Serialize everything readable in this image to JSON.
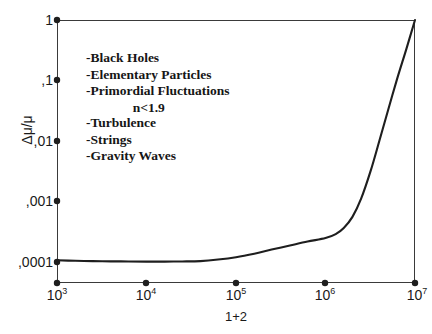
{
  "chart_data": {
    "type": "line",
    "title": "",
    "xlabel": "1+2",
    "ylabel": "Δμ/μ",
    "xscale": "log",
    "yscale": "log",
    "xlim": [
      1000,
      10000000
    ],
    "ylim": [
      5e-05,
      1
    ],
    "grid": false,
    "legend": null,
    "x_tick_labels": [
      "10",
      "10",
      "10",
      "10",
      "10"
    ],
    "x_tick_exponents": [
      "3",
      "4",
      "5",
      "6",
      "7"
    ],
    "x_tick_values": [
      1000,
      10000,
      100000,
      1000000,
      10000000
    ],
    "y_tick_labels": [
      "1",
      ",1",
      ",01",
      ",001",
      ",0001"
    ],
    "y_tick_values": [
      1,
      0.1,
      0.01,
      0.001,
      0.0001
    ],
    "series": [
      {
        "name": "Δμ/μ",
        "color": "#1e1e1e",
        "x": [
          1000,
          1600,
          2500,
          4000,
          6300,
          10000,
          16000,
          25000,
          40000,
          63000,
          100000,
          160000,
          250000,
          400000,
          630000,
          1000000,
          1300000,
          1600000,
          2000000,
          2500000,
          3200000,
          4000000,
          5000000,
          6300000,
          8000000,
          10000000
        ],
        "y": [
          0.000105,
          0.000103,
          0.000102,
          0.000101,
          0.0001005,
          0.0001,
          0.0001,
          0.0001005,
          0.000102,
          0.000108,
          0.000118,
          0.000135,
          0.000158,
          0.000185,
          0.000215,
          0.000245,
          0.000285,
          0.00036,
          0.00055,
          0.0011,
          0.0032,
          0.01,
          0.032,
          0.105,
          0.33,
          1.0
        ]
      }
    ],
    "annotations": [
      {
        "id": "annot-group-1",
        "lines": [
          "-Black Holes",
          "-Elementary Particles",
          "-Primordial Fluctuations"
        ],
        "centered_line": "n<1.9"
      },
      {
        "id": "annot-group-2",
        "lines": [
          "-Turbulence",
          "-Strings",
          "-Gravity Waves"
        ]
      }
    ]
  },
  "axes": {
    "y_title": "Δμ/μ",
    "x_title": "1+2",
    "y_ticks": [
      {
        "label": "1"
      },
      {
        "label": ",1"
      },
      {
        "label": ",01"
      },
      {
        "label": ",001"
      },
      {
        "label": ",0001"
      }
    ],
    "x_ticks": [
      {
        "mantissa": "10",
        "exponent": "3"
      },
      {
        "mantissa": "10",
        "exponent": "4"
      },
      {
        "mantissa": "10",
        "exponent": "5"
      },
      {
        "mantissa": "10",
        "exponent": "6"
      },
      {
        "mantissa": "10",
        "exponent": "7"
      }
    ]
  },
  "annotations": {
    "group1": {
      "line1": "-Black Holes",
      "line2": "-Elementary Particles",
      "line3": "-Primordial Fluctuations",
      "line4": "n<1.9"
    },
    "group2": {
      "line1": "-Turbulence",
      "line2": "-Strings",
      "line3": "-Gravity Waves"
    }
  },
  "colors": {
    "curve": "#1e1e1e",
    "axis": "#3a3a3a",
    "text": "#1a1a1a",
    "background": "#ffffff"
  }
}
